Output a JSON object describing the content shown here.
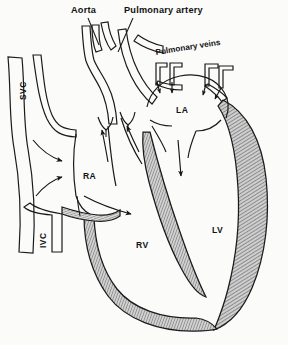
{
  "figure": {
    "background_color": "#fbfbfa",
    "ink_color": "#1a1a1a",
    "wall_fill_color": "#c9c9c9",
    "style": "pen-and-ink line drawing with hatched muscle walls"
  },
  "labels": {
    "aorta": "Aorta",
    "pulmonary_artery": "Pulmonary artery",
    "pulmonary_veins": "Pulmonary veins",
    "svc": "SVC",
    "ivc": "IVC",
    "right_atrium": "RA",
    "right_ventricle": "RV",
    "left_atrium": "LA",
    "left_ventricle": "LV"
  },
  "structures": [
    {
      "name": "aorta",
      "label": "Aorta",
      "kind": "great-vessel",
      "side": "left"
    },
    {
      "name": "pulmonary-artery",
      "label": "Pulmonary artery",
      "kind": "great-vessel",
      "side": "left"
    },
    {
      "name": "pulmonary-veins",
      "label": "Pulmonary veins",
      "kind": "vein-group",
      "count": 4,
      "side": "right"
    },
    {
      "name": "superior-vena-cava",
      "label": "SVC",
      "kind": "great-vein",
      "side": "far-left"
    },
    {
      "name": "inferior-vena-cava",
      "label": "IVC",
      "kind": "great-vein",
      "side": "far-left"
    },
    {
      "name": "right-atrium",
      "label": "RA",
      "kind": "chamber"
    },
    {
      "name": "right-ventricle",
      "label": "RV",
      "kind": "chamber"
    },
    {
      "name": "left-atrium",
      "label": "LA",
      "kind": "chamber"
    },
    {
      "name": "left-ventricle",
      "label": "LV",
      "kind": "chamber"
    },
    {
      "name": "interventricular-septum",
      "label": "",
      "kind": "wall"
    },
    {
      "name": "tricuspid-valve",
      "label": "",
      "kind": "valve"
    },
    {
      "name": "pulmonary-valve",
      "label": "",
      "kind": "valve"
    },
    {
      "name": "aortic-valve",
      "label": "",
      "kind": "valve"
    }
  ],
  "flow_arrows": [
    {
      "name": "svc-to-ra",
      "from": "SVC",
      "to": "RA"
    },
    {
      "name": "ivc-to-ra",
      "from": "IVC",
      "to": "RA"
    },
    {
      "name": "ra-to-rv",
      "from": "RA",
      "to": "RV"
    },
    {
      "name": "rv-to-pulmonary-valve",
      "from": "RV",
      "to": "Pulmonary artery"
    },
    {
      "name": "lv-to-aortic-valve",
      "from": "LV",
      "to": "Aorta"
    },
    {
      "name": "pulmonary-vein-1-to-la",
      "from": "Pulmonary veins",
      "to": "LA"
    },
    {
      "name": "pulmonary-vein-2-to-la",
      "from": "Pulmonary veins",
      "to": "LA"
    },
    {
      "name": "pulmonary-vein-3-to-la",
      "from": "Pulmonary veins",
      "to": "LA"
    },
    {
      "name": "pulmonary-vein-4-to-la",
      "from": "Pulmonary veins",
      "to": "LA"
    },
    {
      "name": "la-to-lv",
      "from": "LA",
      "to": "LV"
    }
  ],
  "leader_lines": [
    {
      "name": "aorta-leader",
      "for": "Aorta"
    },
    {
      "name": "pulmonary-artery-leader",
      "for": "Pulmonary artery"
    }
  ]
}
